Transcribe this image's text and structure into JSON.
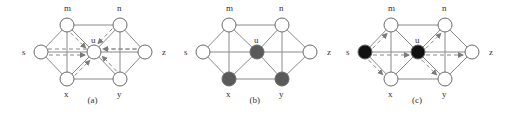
{
  "figure": {
    "panels": [
      {
        "id": "a",
        "caption": "(a)",
        "offset_x": 0,
        "nodes": [
          {
            "id": "s",
            "label": "s",
            "x": 41,
            "y": 52,
            "fill": "#ffffff",
            "label_dx": -19,
            "label_dy": 3
          },
          {
            "id": "m",
            "label": "m",
            "x": 67,
            "y": 25,
            "fill": "#ffffff",
            "label_dx": -3,
            "label_dy": -14
          },
          {
            "id": "n",
            "label": "n",
            "x": 120,
            "y": 25,
            "fill": "#ffffff",
            "label_dx": -3,
            "label_dy": -14
          },
          {
            "id": "u",
            "label": "u",
            "x": 94,
            "y": 52,
            "fill": "#ffffff",
            "label_dx": -3,
            "label_dy": -9
          },
          {
            "id": "z",
            "label": "z",
            "x": 145,
            "y": 52,
            "fill": "#ffffff",
            "label_dx": 17,
            "label_dy": 3
          },
          {
            "id": "x",
            "label": "x",
            "x": 67,
            "y": 79,
            "fill": "#ffffff",
            "label_dx": -3,
            "label_dy": 18
          },
          {
            "id": "y",
            "label": "y",
            "x": 120,
            "y": 79,
            "fill": "#ffffff",
            "label_dx": -3,
            "label_dy": 18
          }
        ],
        "dashed_arrows": [
          [
            "s",
            "u"
          ],
          [
            "z",
            "u"
          ],
          [
            "m",
            "u"
          ],
          [
            "n",
            "u"
          ],
          [
            "x",
            "u"
          ],
          [
            "y",
            "u"
          ]
        ],
        "dashed_lines": [
          [
            "s",
            "z"
          ]
        ]
      },
      {
        "id": "b",
        "caption": "(b)",
        "offset_x": 162,
        "nodes": [
          {
            "id": "s",
            "label": "s",
            "x": 41,
            "y": 52,
            "fill": "#ffffff",
            "label_dx": -19,
            "label_dy": 3
          },
          {
            "id": "m",
            "label": "m",
            "x": 67,
            "y": 25,
            "fill": "#ffffff",
            "label_dx": -3,
            "label_dy": -14
          },
          {
            "id": "n",
            "label": "n",
            "x": 120,
            "y": 25,
            "fill": "#ffffff",
            "label_dx": -3,
            "label_dy": -14
          },
          {
            "id": "u",
            "label": "u",
            "x": 95,
            "y": 52,
            "fill": "#5a5a5a",
            "label_dx": -3,
            "label_dy": -9
          },
          {
            "id": "z",
            "label": "z",
            "x": 148,
            "y": 52,
            "fill": "#ffffff",
            "label_dx": 17,
            "label_dy": 3
          },
          {
            "id": "x",
            "label": "x",
            "x": 67,
            "y": 79,
            "fill": "#5a5a5a",
            "label_dx": -3,
            "label_dy": 18
          },
          {
            "id": "y",
            "label": "y",
            "x": 120,
            "y": 79,
            "fill": "#5a5a5a",
            "label_dx": -3,
            "label_dy": 18
          }
        ],
        "dashed_arrows": [],
        "dashed_lines": []
      },
      {
        "id": "c",
        "caption": "(c)",
        "offset_x": 324,
        "nodes": [
          {
            "id": "s",
            "label": "s",
            "x": 41,
            "y": 52,
            "fill": "#111111",
            "label_dx": -19,
            "label_dy": 3
          },
          {
            "id": "m",
            "label": "m",
            "x": 67,
            "y": 25,
            "fill": "#ffffff",
            "label_dx": -3,
            "label_dy": -14
          },
          {
            "id": "n",
            "label": "n",
            "x": 121,
            "y": 25,
            "fill": "#ffffff",
            "label_dx": -3,
            "label_dy": -14
          },
          {
            "id": "u",
            "label": "u",
            "x": 94,
            "y": 52,
            "fill": "#111111",
            "label_dx": -3,
            "label_dy": -9
          },
          {
            "id": "z",
            "label": "z",
            "x": 148,
            "y": 52,
            "fill": "#ffffff",
            "label_dx": 17,
            "label_dy": 3
          },
          {
            "id": "x",
            "label": "x",
            "x": 67,
            "y": 79,
            "fill": "#ffffff",
            "label_dx": -3,
            "label_dy": 18
          },
          {
            "id": "y",
            "label": "y",
            "x": 121,
            "y": 79,
            "fill": "#ffffff",
            "label_dx": -3,
            "label_dy": 18
          }
        ],
        "dashed_arrows": [
          [
            "s",
            "m"
          ],
          [
            "s",
            "u"
          ],
          [
            "s",
            "x"
          ],
          [
            "u",
            "n"
          ],
          [
            "u",
            "z"
          ],
          [
            "u",
            "y"
          ]
        ],
        "dashed_lines": []
      }
    ],
    "edges": [
      [
        "s",
        "m"
      ],
      [
        "s",
        "x"
      ],
      [
        "s",
        "z"
      ],
      [
        "m",
        "n"
      ],
      [
        "x",
        "y"
      ],
      [
        "m",
        "x"
      ],
      [
        "n",
        "y"
      ],
      [
        "m",
        "u"
      ],
      [
        "n",
        "u"
      ],
      [
        "x",
        "u"
      ],
      [
        "y",
        "u"
      ],
      [
        "n",
        "z"
      ],
      [
        "y",
        "z"
      ]
    ],
    "node_radius": 7,
    "caption_y": 103,
    "colors": {
      "edge": "#8a8a8a",
      "node_stroke": "#6a6a6a",
      "label": "#333333"
    }
  }
}
